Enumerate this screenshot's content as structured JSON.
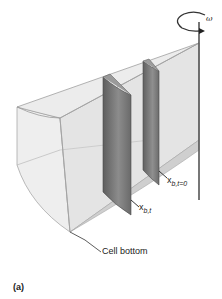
{
  "figure": {
    "panel_label": "(a)",
    "rotation_label": "ω",
    "labels": {
      "boundary_initial": {
        "main": "x",
        "sub": "b,t=0"
      },
      "boundary_time_t": {
        "main": "x",
        "sub": "b,t"
      },
      "cell_bottom": "Cell bottom"
    },
    "colors": {
      "sector_face_light": "#e9e9e9",
      "sector_face_mid": "#dcdcdc",
      "sector_edge": "#9a9a9a",
      "boundary_dark": "#6f6f6f",
      "boundary_mid": "#8a8a8a",
      "axis": "#555555"
    }
  }
}
